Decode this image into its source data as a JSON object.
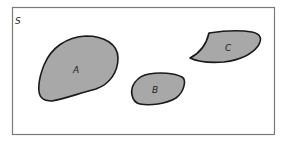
{
  "diagram": {
    "type": "venn-disjoint-sets",
    "universe_label": "S",
    "sets": [
      {
        "id": "A",
        "label": "A"
      },
      {
        "id": "B",
        "label": "B"
      },
      {
        "id": "C",
        "label": "C"
      }
    ],
    "colors": {
      "set_fill": "#a8a8a8",
      "set_stroke": "#1a1a1a",
      "frame_stroke": "#7a7a7a",
      "background": "#ffffff"
    }
  }
}
